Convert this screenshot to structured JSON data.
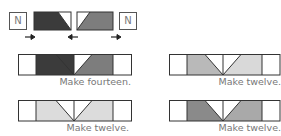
{
  "top": {
    "left_label": "N",
    "right_label": "N",
    "dark_color": "#3b3b3b",
    "mid_color": "#7d7d7d",
    "arrows": [
      "right-arrow",
      "left-arrow",
      "right-arrow"
    ]
  },
  "strips": [
    {
      "caption": "Make fourteen.",
      "left_fill": "#3b3b3b",
      "right_fill": "#7d7d7d"
    },
    {
      "caption": "Make twelve.",
      "left_fill": "#b9b9b9",
      "right_fill": "#d9d9d9"
    },
    {
      "caption": "Make twelve.",
      "left_fill": "#d9d9d9",
      "right_fill": "#d9d9d9"
    },
    {
      "caption": "Make twelve.",
      "left_fill": "#8a8a8a",
      "right_fill": "#a9a9a9"
    }
  ]
}
